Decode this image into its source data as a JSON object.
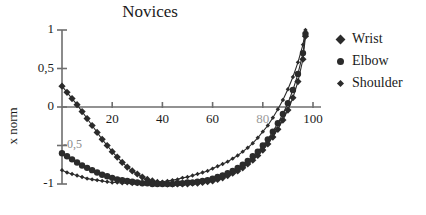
{
  "chart_data": {
    "type": "scatter",
    "title": "Novices",
    "xlabel": "",
    "ylabel": "x norm",
    "xlim": [
      0,
      103
    ],
    "ylim": [
      -1.12,
      1.05
    ],
    "grid": false,
    "legend_position": "right",
    "xticks": [
      20,
      40,
      60,
      80,
      100
    ],
    "xtick_labels": [
      "20",
      "40",
      "60",
      "80",
      "100"
    ],
    "xtick_hidden": [
      "80"
    ],
    "yticks": [
      1,
      0.5,
      0,
      -0.5,
      -1
    ],
    "ytick_labels": [
      "1",
      "0,5",
      "0",
      "-0,5",
      "-1"
    ],
    "ytick_obscured": [
      "-0,5"
    ],
    "series": [
      {
        "name": "Wrist",
        "marker": "diamond",
        "color": "#2b2b2b",
        "x": [
          0,
          2,
          4,
          6,
          8,
          10,
          12,
          14,
          16,
          18,
          20,
          22,
          24,
          26,
          28,
          30,
          32,
          34,
          36,
          38,
          40,
          42,
          44,
          46,
          48,
          50,
          52,
          54,
          56,
          58,
          60,
          62,
          64,
          66,
          68,
          70,
          72,
          74,
          76,
          78,
          80,
          82,
          84,
          86,
          88,
          90,
          92,
          94,
          96,
          97
        ],
        "y": [
          0.27,
          0.19,
          0.11,
          0.03,
          -0.06,
          -0.15,
          -0.24,
          -0.33,
          -0.42,
          -0.5,
          -0.58,
          -0.65,
          -0.72,
          -0.78,
          -0.83,
          -0.87,
          -0.91,
          -0.94,
          -0.96,
          -0.98,
          -0.99,
          -1.0,
          -1.0,
          -1.0,
          -1.0,
          -1.0,
          -0.99,
          -0.99,
          -0.98,
          -0.97,
          -0.96,
          -0.94,
          -0.92,
          -0.89,
          -0.86,
          -0.83,
          -0.79,
          -0.74,
          -0.69,
          -0.63,
          -0.56,
          -0.48,
          -0.39,
          -0.29,
          -0.17,
          -0.04,
          0.12,
          0.33,
          0.62,
          0.92
        ]
      },
      {
        "name": "Elbow",
        "marker": "circle",
        "color": "#2b2b2b",
        "x": [
          0,
          2,
          4,
          6,
          8,
          10,
          12,
          14,
          16,
          18,
          20,
          22,
          24,
          26,
          28,
          30,
          32,
          34,
          36,
          38,
          40,
          42,
          44,
          46,
          48,
          50,
          52,
          54,
          56,
          58,
          60,
          62,
          64,
          66,
          68,
          70,
          72,
          74,
          76,
          78,
          80,
          82,
          84,
          86,
          88,
          90,
          92,
          94,
          96,
          97
        ],
        "y": [
          -0.6,
          -0.64,
          -0.68,
          -0.72,
          -0.76,
          -0.79,
          -0.82,
          -0.85,
          -0.88,
          -0.9,
          -0.92,
          -0.94,
          -0.95,
          -0.96,
          -0.97,
          -0.98,
          -0.99,
          -0.99,
          -1.0,
          -1.0,
          -1.0,
          -1.0,
          -1.0,
          -0.99,
          -0.99,
          -0.98,
          -0.98,
          -0.97,
          -0.96,
          -0.95,
          -0.93,
          -0.91,
          -0.89,
          -0.86,
          -0.83,
          -0.79,
          -0.75,
          -0.7,
          -0.64,
          -0.58,
          -0.5,
          -0.42,
          -0.32,
          -0.21,
          -0.09,
          0.05,
          0.22,
          0.43,
          0.7,
          0.95
        ]
      },
      {
        "name": "Shoulder",
        "marker": "diamond-small",
        "color": "#2b2b2b",
        "x": [
          0,
          2,
          4,
          6,
          8,
          10,
          12,
          14,
          16,
          18,
          20,
          22,
          24,
          26,
          28,
          30,
          32,
          34,
          36,
          38,
          40,
          42,
          44,
          46,
          48,
          50,
          52,
          54,
          56,
          58,
          60,
          62,
          64,
          66,
          68,
          70,
          72,
          74,
          76,
          78,
          80,
          82,
          84,
          86,
          88,
          90,
          92,
          94,
          96,
          97
        ],
        "y": [
          -0.82,
          -0.85,
          -0.87,
          -0.89,
          -0.91,
          -0.93,
          -0.94,
          -0.95,
          -0.96,
          -0.97,
          -0.98,
          -0.98,
          -0.99,
          -0.99,
          -1.0,
          -1.0,
          -1.0,
          -0.99,
          -0.99,
          -0.98,
          -0.97,
          -0.96,
          -0.95,
          -0.94,
          -0.92,
          -0.91,
          -0.89,
          -0.87,
          -0.85,
          -0.83,
          -0.8,
          -0.77,
          -0.74,
          -0.71,
          -0.67,
          -0.63,
          -0.58,
          -0.53,
          -0.47,
          -0.4,
          -0.32,
          -0.24,
          -0.14,
          -0.03,
          0.09,
          0.23,
          0.39,
          0.58,
          0.81,
          1.0
        ]
      }
    ]
  },
  "legend": {
    "items": [
      {
        "label": "Wrist",
        "marker": "diamond"
      },
      {
        "label": "Elbow",
        "marker": "circle"
      },
      {
        "label": "Shoulder",
        "marker": "diamond-small"
      }
    ]
  }
}
